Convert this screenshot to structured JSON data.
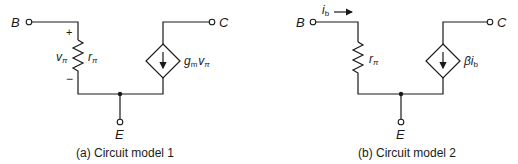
{
  "circuits": [
    {
      "id": "a",
      "caption": "(a) Circuit model 1",
      "terminals": {
        "base": "B",
        "collector": "C",
        "emitter": "E"
      },
      "resistor_label": "r",
      "resistor_sub": "π",
      "voltage_label": "v",
      "voltage_sub": "π",
      "plus": "+",
      "minus": "−",
      "source_label_main": "g",
      "source_label_sub": "m",
      "source_label_tail": "v",
      "source_label_tail_sub": "π"
    },
    {
      "id": "b",
      "caption": "(b) Circuit model 2",
      "terminals": {
        "base": "B",
        "collector": "C",
        "emitter": "E"
      },
      "resistor_label": "r",
      "resistor_sub": "π",
      "current_label": "i",
      "current_sub": "b",
      "source_label_main": "βi",
      "source_label_sub": "b"
    }
  ]
}
